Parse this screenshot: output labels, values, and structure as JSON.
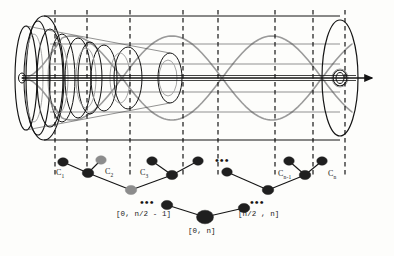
{
  "figure": {
    "type": "hierarchical-cluster-cone-diagram",
    "width": 394,
    "height": 256,
    "background": "#fdfdfb"
  },
  "colors": {
    "ink": "#141414",
    "gray_curve": "#9a9a9a",
    "node_dark": "#1f1f1f",
    "node_gray": "#8c8c8c",
    "dash": "#0d0d0d",
    "cylinder_line": "#4a4a4a"
  },
  "cylinder": {
    "axis_label": "",
    "arrow": "right-arrow",
    "left_cap_cx": 44,
    "right_cap_cx": 340,
    "cy": 78,
    "cap_ry": 62,
    "cap_rx": 14,
    "dashed_lines_x": [
      55,
      87,
      130,
      183,
      218,
      275,
      313,
      345
    ],
    "cone_ellipses": [
      {
        "cx": 26,
        "rx": 11,
        "ry": 52
      },
      {
        "cx": 38,
        "rx": 12,
        "ry": 57
      },
      {
        "cx": 50,
        "rx": 13,
        "ry": 49
      },
      {
        "cx": 62,
        "rx": 13,
        "ry": 44
      },
      {
        "cx": 78,
        "rx": 13,
        "ry": 40
      },
      {
        "cx": 90,
        "rx": 12,
        "ry": 36
      },
      {
        "cx": 104,
        "rx": 13,
        "ry": 33
      },
      {
        "cx": 128,
        "rx": 14,
        "ry": 31
      },
      {
        "cx": 170,
        "rx": 12,
        "ry": 25
      },
      {
        "cx": 340,
        "rx": 7,
        "ry": 8
      }
    ]
  },
  "wave": {
    "type": "sinusoidal-envelope",
    "amplitude": 42,
    "nodes_x": [
      60,
      112,
      160,
      212,
      262,
      312,
      345
    ],
    "color": "#9a9a9a"
  },
  "tree": {
    "caption": "",
    "leaves": [
      {
        "id": "c1",
        "label": "C",
        "sub": "1",
        "x": 63,
        "y": 162,
        "color": "dark",
        "r": 4.2
      },
      {
        "id": "c2",
        "label": "C",
        "sub": "2",
        "x": 101,
        "y": 160,
        "color": "gray",
        "r": 4.2
      },
      {
        "id": "c3",
        "label": "C",
        "sub": "3",
        "x": 152,
        "y": 161,
        "color": "dark",
        "r": 4.2
      },
      {
        "id": "c4",
        "label": "",
        "sub": "",
        "x": 198,
        "y": 161,
        "color": "dark",
        "r": 4.2
      },
      {
        "id": "c5",
        "label": "",
        "sub": "",
        "x": 227,
        "y": 172,
        "color": "dark",
        "r": 4.2
      },
      {
        "id": "cn1",
        "label": "C",
        "sub": "n-1",
        "x": 289,
        "y": 161,
        "color": "dark",
        "r": 4.2
      },
      {
        "id": "cn",
        "label": "C",
        "sub": "n",
        "x": 322,
        "y": 161,
        "color": "dark",
        "r": 4.2
      }
    ],
    "internal_nodes": [
      {
        "id": "i1",
        "x": 88,
        "y": 173,
        "color": "dark",
        "r": 4.6
      },
      {
        "id": "i2",
        "x": 172,
        "y": 175,
        "color": "dark",
        "r": 4.6
      },
      {
        "id": "i3",
        "x": 131,
        "y": 190,
        "color": "gray",
        "r": 4.6
      },
      {
        "id": "i4",
        "x": 268,
        "y": 190,
        "color": "dark",
        "r": 4.6
      },
      {
        "id": "i5",
        "x": 305,
        "y": 175,
        "color": "dark",
        "r": 4.6
      },
      {
        "id": "l1",
        "x": 167,
        "y": 205,
        "color": "dark",
        "r": 4.6
      },
      {
        "id": "l2",
        "x": 244,
        "y": 208,
        "color": "dark",
        "r": 4.6
      },
      {
        "id": "root",
        "x": 205,
        "y": 217,
        "color": "dark",
        "r": 6.8
      }
    ],
    "edges": [
      [
        "c1",
        "i1"
      ],
      [
        "c2",
        "i1"
      ],
      [
        "i1",
        "i3"
      ],
      [
        "c3",
        "i2"
      ],
      [
        "c4",
        "i2"
      ],
      [
        "i2",
        "i3"
      ],
      [
        "c5",
        "i4"
      ],
      [
        "cn1",
        "i5"
      ],
      [
        "cn",
        "i5"
      ],
      [
        "i5",
        "i4"
      ],
      [
        "l1",
        "root"
      ],
      [
        "l2",
        "root"
      ]
    ],
    "ellipses": [
      {
        "id": "dots-mid-top",
        "x": 215,
        "y": 155,
        "text": "•••"
      },
      {
        "id": "dots-left-low",
        "x": 140,
        "y": 197,
        "text": "•••"
      },
      {
        "id": "dots-right-low",
        "x": 250,
        "y": 197,
        "text": "•••"
      }
    ],
    "interval_labels": [
      {
        "id": "left-interval",
        "text": "[0, n/2 - 1]",
        "x": 116,
        "y": 210
      },
      {
        "id": "right-interval",
        "text": "[n/2 , n]",
        "x": 238,
        "y": 210
      },
      {
        "id": "root-interval",
        "text": "[0, n]",
        "x": 188,
        "y": 227
      }
    ],
    "cluster_labels": [
      {
        "id": "label-c1",
        "text": "C",
        "sub": "1",
        "x": 56,
        "y": 168
      },
      {
        "id": "label-c2",
        "text": "C",
        "sub": "2",
        "x": 105,
        "y": 167
      },
      {
        "id": "label-c3",
        "text": "C",
        "sub": "3",
        "x": 140,
        "y": 168
      },
      {
        "id": "label-cn1",
        "text": "C",
        "sub": "n-1",
        "x": 278,
        "y": 169
      },
      {
        "id": "label-cn",
        "text": "C",
        "sub": "n",
        "x": 328,
        "y": 169
      }
    ]
  }
}
